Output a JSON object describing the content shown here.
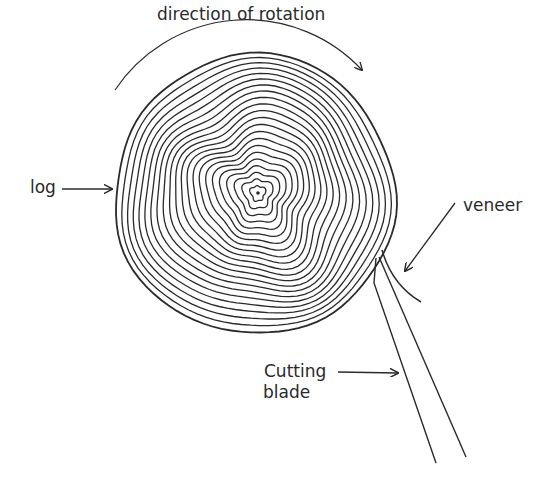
{
  "diagram": {
    "title": "direction of rotation",
    "labels": {
      "rotation": "direction of rotation",
      "log": "log",
      "veneer": "veneer",
      "blade_line1": "Cutting",
      "blade_line2": "blade"
    },
    "colors": {
      "ink": "#2a2a2a",
      "background": "#ffffff"
    }
  }
}
